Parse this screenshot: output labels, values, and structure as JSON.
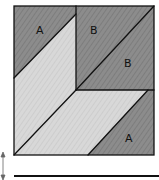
{
  "diagram": {
    "title": "",
    "labels": {
      "a_top": "A",
      "b_top": "B",
      "b_right": "B",
      "a_bottom": "A"
    },
    "colors": {
      "dark": "#8a8a8a",
      "light": "#d4d4d4",
      "stroke": "#111111",
      "background": "#ffffff"
    }
  }
}
